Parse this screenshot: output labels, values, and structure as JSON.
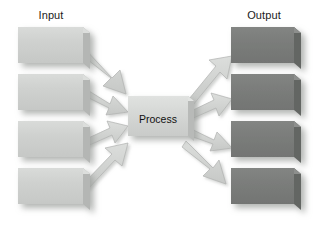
{
  "diagram": {
    "type": "process-flow",
    "title_input": "Input",
    "title_output": "Output",
    "process_label": "Process",
    "colors": {
      "input_box_face": "#cfd1cf",
      "input_box_top": "#dcdedc",
      "input_box_side": "#b4b6b4",
      "output_box_face": "#7b7d7b",
      "output_box_top": "#8d8f8d",
      "output_box_side": "#646664",
      "process_face": "#d5d7d5",
      "process_top": "#e2e4e2",
      "process_side": "#b8bab8",
      "arrow_fill": "#d2d4d2",
      "arrow_edge": "#a8aaa8",
      "label_text": "#1a1a1a",
      "background": "#ffffff",
      "shadow": "#b9bbb9"
    },
    "input_boxes": [
      {
        "id": "input-box-1",
        "label": ""
      },
      {
        "id": "input-box-2",
        "label": ""
      },
      {
        "id": "input-box-3",
        "label": ""
      },
      {
        "id": "input-box-4",
        "label": ""
      }
    ],
    "output_boxes": [
      {
        "id": "output-box-1",
        "label": ""
      },
      {
        "id": "output-box-2",
        "label": ""
      },
      {
        "id": "output-box-3",
        "label": ""
      },
      {
        "id": "output-box-4",
        "label": ""
      }
    ],
    "input_arrows": [
      {
        "id": "input-arrow-1",
        "from": "input-box-1",
        "to": "process"
      },
      {
        "id": "input-arrow-2",
        "from": "input-box-2",
        "to": "process"
      },
      {
        "id": "input-arrow-3",
        "from": "input-box-3",
        "to": "process"
      },
      {
        "id": "input-arrow-4",
        "from": "input-box-4",
        "to": "process"
      }
    ],
    "output_arrows": [
      {
        "id": "output-arrow-1",
        "from": "process",
        "to": "output-box-1"
      },
      {
        "id": "output-arrow-2",
        "from": "process",
        "to": "output-box-2"
      },
      {
        "id": "output-arrow-3",
        "from": "process",
        "to": "output-box-3"
      },
      {
        "id": "output-arrow-4",
        "from": "process",
        "to": "output-box-4"
      }
    ]
  }
}
